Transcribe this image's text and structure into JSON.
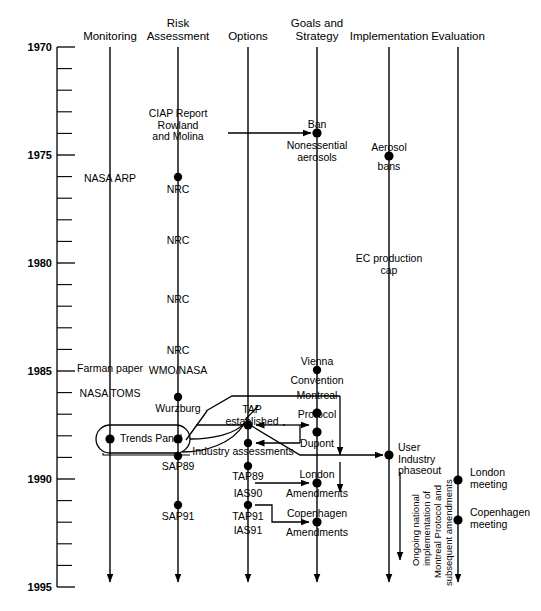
{
  "figure": {
    "type": "timeline-diagram",
    "axis": {
      "orientation": "vertical",
      "label_years": [
        "1970",
        "1975",
        "1980",
        "1985",
        "1990",
        "1995"
      ],
      "tick_interval_years": 1,
      "range": [
        1970,
        1995
      ]
    },
    "columns": [
      {
        "id": "monitoring",
        "label": "Monitoring"
      },
      {
        "id": "risk_assessment",
        "label": "Risk\nAssessment",
        "line1": "Risk",
        "line2": "Assessment"
      },
      {
        "id": "options",
        "label": "Options"
      },
      {
        "id": "goals_strategy",
        "label": "Goals and\nStrategy",
        "line1": "Goals and",
        "line2": "Strategy"
      },
      {
        "id": "implementation",
        "label": "Implementation"
      },
      {
        "id": "evaluation",
        "label": "Evaluation"
      }
    ],
    "events": [
      {
        "id": "ciap",
        "column": "risk_assessment",
        "year": 1974.0,
        "text": "CIAP Report\nRowland\nand Molina",
        "dot": false
      },
      {
        "id": "nrc74",
        "column": "risk_assessment",
        "year": 1976.2,
        "text": "NRC",
        "dot": true
      },
      {
        "id": "nrc79",
        "column": "risk_assessment",
        "year": 1979.4,
        "text": "NRC",
        "dot": false
      },
      {
        "id": "nrc82",
        "column": "risk_assessment",
        "year": 1982.2,
        "text": "NRC",
        "dot": false
      },
      {
        "id": "nrc84",
        "column": "risk_assessment",
        "year": 1984.6,
        "text": "NRC",
        "dot": false
      },
      {
        "id": "wmo_nasa",
        "column": "risk_assessment",
        "year": 1985.4,
        "text": "WMO/NASA",
        "dot": false
      },
      {
        "id": "wurzburg",
        "column": "risk_assessment",
        "year": 1987.0,
        "text": "Wurzburg",
        "dot": true
      },
      {
        "id": "trends_panel",
        "column": "risk_assessment",
        "year": 1988.5,
        "text": "Trends Panel",
        "dot": true,
        "oval": true
      },
      {
        "id": "sap89",
        "column": "risk_assessment",
        "year": 1989.2,
        "text": "SAP89",
        "dot": true
      },
      {
        "id": "sap91",
        "column": "risk_assessment",
        "year": 1991.4,
        "text": "SAP91",
        "dot": true
      },
      {
        "id": "nasa_arp",
        "column": "monitoring",
        "year": 1976.2,
        "text": "NASA ARP",
        "dot": false
      },
      {
        "id": "farman",
        "column": "monitoring",
        "year": 1985.3,
        "text": "Farman paper",
        "dot": false
      },
      {
        "id": "nasa_toms",
        "column": "monitoring",
        "year": 1986.2,
        "text": "NASA TOMS",
        "dot": false
      },
      {
        "id": "tap_est",
        "column": "options",
        "year": 1988.2,
        "text": "TAP\nestablished",
        "dot": true
      },
      {
        "id": "ind_assess",
        "column": "options",
        "year": 1989.0,
        "text": "Industry assessments",
        "dot": true
      },
      {
        "id": "tap89",
        "column": "options",
        "year": 1989.8,
        "text": "TAP89\nIAS90",
        "dot": true
      },
      {
        "id": "tap91",
        "column": "options",
        "year": 1991.4,
        "text": "TAP91\nIAS91",
        "dot": true
      },
      {
        "id": "ban",
        "column": "goals_strategy",
        "year": 1974.8,
        "text": "Ban",
        "dot": true
      },
      {
        "id": "nonessential",
        "column": "goals_strategy",
        "year": 1975.6,
        "text": "Nonessential\naerosols",
        "dot": false
      },
      {
        "id": "vienna",
        "column": "goals_strategy",
        "year": 1984.8,
        "text": "Vienna\nConvention",
        "dot": true
      },
      {
        "id": "montreal",
        "column": "goals_strategy",
        "year": 1987.2,
        "text": "Montreal\nProtocol",
        "dot": true
      },
      {
        "id": "dupont",
        "column": "goals_strategy",
        "year": 1988.1,
        "text": "Dupont",
        "dot": true
      },
      {
        "id": "london_am",
        "column": "goals_strategy",
        "year": 1990.1,
        "text": "London\nAmendments",
        "dot": true
      },
      {
        "id": "copenhagen_am",
        "column": "goals_strategy",
        "year": 1992.0,
        "text": "Copenhagen\nAmendments",
        "dot": true
      },
      {
        "id": "aerosol_bans",
        "column": "implementation",
        "year": 1975.2,
        "text": "Aerosol\nbans",
        "dot": true
      },
      {
        "id": "ec_cap",
        "column": "implementation",
        "year": 1980.2,
        "text": "EC production\ncap",
        "dot": false
      },
      {
        "id": "user_phaseout",
        "column": "implementation",
        "year": 1989.5,
        "text": "User\nIndustry\nphaseout",
        "dot": true
      },
      {
        "id": "london_mtg",
        "column": "evaluation",
        "year": 1990.0,
        "text": "London\nmeeting",
        "dot": true
      },
      {
        "id": "copenhagen_mtg",
        "column": "evaluation",
        "year": 1991.8,
        "text": "Copenhagen\nmeeting",
        "dot": true
      }
    ],
    "annotations": {
      "ongoing": "Ongoing national\nimplementation of\nMontreal Protocol and\nsubsequent amendments",
      "ongoing_lines": [
        "Ongoing national",
        "implementation of",
        "Montreal Protocol and",
        "subsequent amendments"
      ]
    },
    "labels": {
      "monitoring": "Monitoring",
      "risk_line1": "Risk",
      "risk_line2": "Assessment",
      "options": "Options",
      "goals_line1": "Goals and",
      "goals_line2": "Strategy",
      "implementation": "Implementation",
      "evaluation": "Evaluation",
      "y1970": "1970",
      "y1975": "1975",
      "y1980": "1980",
      "y1985": "1985",
      "y1990": "1990",
      "y1995": "1995",
      "ciap_l1": "CIAP Report",
      "ciap_l2": "Rowland",
      "ciap_l3": "and Molina",
      "nrc1": "NRC",
      "nrc2": "NRC",
      "nrc3": "NRC",
      "nrc4": "NRC",
      "wmo_nasa": "WMO/NASA",
      "wurzburg": "Wurzburg",
      "trends_panel": "Trends Panel",
      "sap89": "SAP89",
      "sap91": "SAP91",
      "nasa_arp": "NASA ARP",
      "farman": "Farman paper",
      "nasa_toms": "NASA TOMS",
      "tap_l1": "TAP",
      "tap_l2": "established",
      "ind_assess": "Industry assessments",
      "tap89": "TAP89",
      "ias90": "IAS90",
      "tap91": "TAP91",
      "ias91": "IAS91",
      "ban": "Ban",
      "none_l1": "Nonessential",
      "none_l2": "aerosols",
      "vienna_l1": "Vienna",
      "vienna_l2": "Convention",
      "montreal_l1": "Montreal",
      "montreal_l2": "Protocol",
      "dupont": "Dupont",
      "london_l1": "London",
      "london_l2": "Amendments",
      "copen_l1": "Copenhagen",
      "copen_l2": "Amendments",
      "aerosol_l1": "Aerosol",
      "aerosol_l2": "bans",
      "ec_l1": "EC production",
      "ec_l2": "cap",
      "user_l1": "User",
      "user_l2": "Industry",
      "user_l3": "phaseout",
      "londonmtg_l1": "London",
      "londonmtg_l2": "meeting",
      "copenmtg_l1": "Copenhagen",
      "copenmtg_l2": "meeting",
      "ong_l1": "Ongoing national",
      "ong_l2": "implementation of",
      "ong_l3": "Montreal Protocol and",
      "ong_l4": "subsequent amendments"
    },
    "colors": {
      "ink": "#000000",
      "background": "#ffffff"
    }
  }
}
